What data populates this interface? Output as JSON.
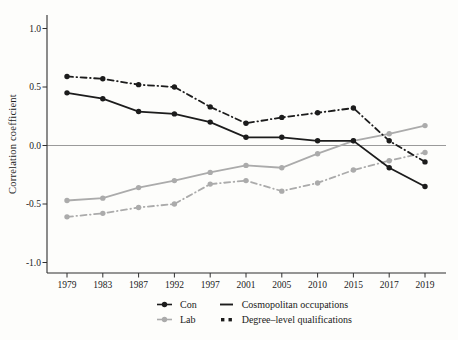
{
  "chart_data": {
    "type": "line",
    "title": "",
    "xlabel": "",
    "ylabel": "Correlation coefficient",
    "x_categories": [
      "1979",
      "1983",
      "1987",
      "1992",
      "1997",
      "2001",
      "2005",
      "2010",
      "2015",
      "2017",
      "2019"
    ],
    "y_ticks": [
      "1.0",
      "0.5",
      "0.0",
      "-0.5",
      "-1.0"
    ],
    "y_tick_values": [
      1.0,
      0.5,
      0.0,
      -0.5,
      -1.0
    ],
    "ylim": [
      -1.05,
      1.05
    ],
    "zero_reference_line": 0.0,
    "grid": "off",
    "markers": "circle",
    "legend_position": "bottom",
    "series": [
      {
        "party": "Con",
        "measure": "Cosmopolitan occupations",
        "color": "#1c1c1c",
        "style": "solid",
        "values": [
          0.45,
          0.4,
          0.29,
          0.27,
          0.2,
          0.07,
          0.07,
          0.04,
          0.04,
          -0.19,
          -0.35
        ]
      },
      {
        "party": "Con",
        "measure": "Degree-level qualifications",
        "color": "#1c1c1c",
        "style": "dash-dot",
        "values": [
          0.59,
          0.57,
          0.52,
          0.5,
          0.33,
          0.19,
          0.24,
          0.28,
          0.32,
          0.04,
          -0.14
        ]
      },
      {
        "party": "Lab",
        "measure": "Cosmopolitan occupations",
        "color": "#ababab",
        "style": "solid",
        "values": [
          -0.47,
          -0.45,
          -0.36,
          -0.3,
          -0.23,
          -0.17,
          -0.19,
          -0.07,
          0.04,
          0.1,
          0.17
        ]
      },
      {
        "party": "Lab",
        "measure": "Degree-level qualifications",
        "color": "#ababab",
        "style": "dash-dot",
        "values": [
          -0.61,
          -0.58,
          -0.53,
          -0.5,
          -0.33,
          -0.3,
          -0.39,
          -0.32,
          -0.21,
          -0.13,
          -0.06
        ]
      }
    ],
    "legend": {
      "party_entries": [
        {
          "label": "Con",
          "color": "#1c1c1c"
        },
        {
          "label": "Lab",
          "color": "#ababab"
        }
      ],
      "measure_entries": [
        {
          "label": "Cosmopolitan occupations",
          "style": "solid",
          "color": "#1c1c1c"
        },
        {
          "label": "Degree–level qualifications",
          "style": "dotted",
          "color": "#1c1c1c"
        }
      ]
    }
  },
  "colors": {
    "black": "#1c1c1c",
    "gray": "#ababab",
    "axis": "#2f2f2f",
    "zero_line": "#8f8f8f",
    "background": "#fdfdfb"
  }
}
